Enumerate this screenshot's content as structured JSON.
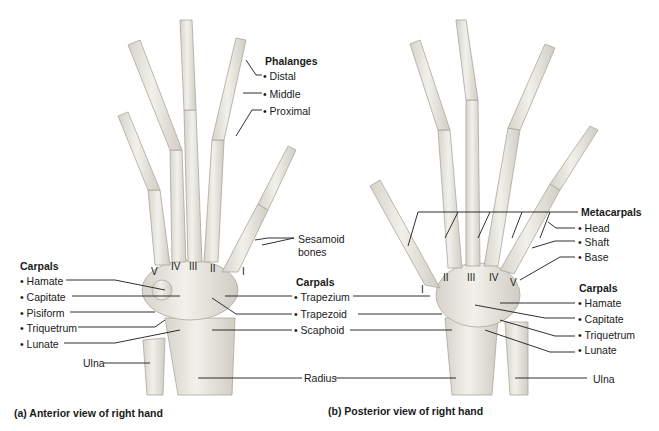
{
  "colors": {
    "bone": "#ecebe4",
    "bone_shade": "#c9c7bd",
    "leader": "#1a1a1a",
    "background": "#ffffff"
  },
  "anterior": {
    "phalanges": {
      "heading": "Phalanges",
      "items": [
        "Distal",
        "Middle",
        "Proximal"
      ]
    },
    "sesamoid": {
      "line1": "Sesamoid",
      "line2": "bones"
    },
    "carpals_left": {
      "heading": "Carpals",
      "items": [
        "Hamate",
        "Capitate",
        "Pisiform",
        "Triquetrum",
        "Lunate"
      ]
    },
    "carpals_center": {
      "heading": "Carpals",
      "items": [
        "Trapezium",
        "Trapezoid",
        "Scaphoid"
      ]
    },
    "ulna": "Ulna",
    "radius": "Radius",
    "numerals": [
      "V",
      "IV",
      "III",
      "II",
      "I"
    ],
    "caption": "(a) Anterior view of right hand"
  },
  "posterior": {
    "metacarpals": {
      "heading": "Metacarpals",
      "items": [
        "Head",
        "Shaft",
        "Base"
      ]
    },
    "carpals": {
      "heading": "Carpals",
      "items": [
        "Hamate",
        "Capitate",
        "Triquetrum",
        "Lunate"
      ]
    },
    "ulna": "Ulna",
    "numerals": [
      "I",
      "II",
      "III",
      "IV",
      "V"
    ],
    "caption": "(b) Posterior view of right hand"
  }
}
